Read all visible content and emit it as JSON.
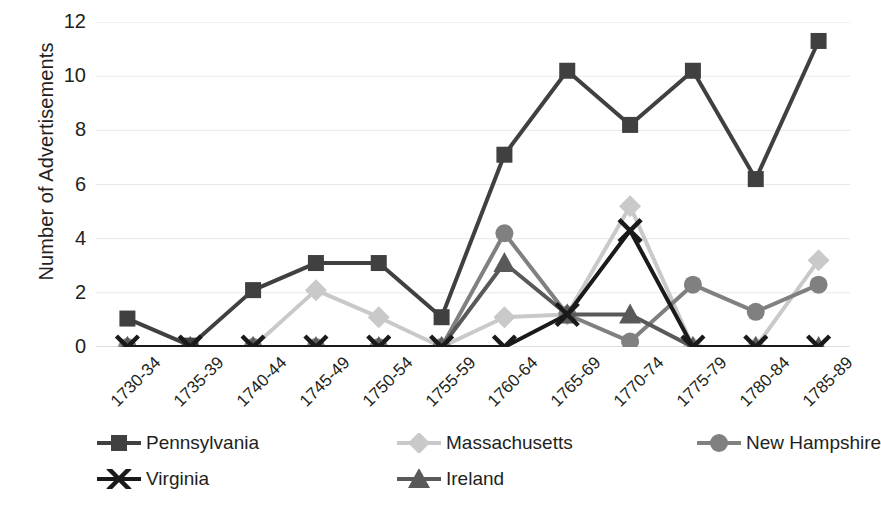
{
  "chart_data": {
    "type": "line",
    "title": "",
    "xlabel": "",
    "ylabel": "Number of Advertisements",
    "categories": [
      "1730-34",
      "1735-39",
      "1740-44",
      "1745-49",
      "1750-54",
      "1755-59",
      "1760-64",
      "1765-69",
      "1770-74",
      "1775-79",
      "1780-84",
      "1785-89"
    ],
    "ylim": [
      0,
      12
    ],
    "yticks": [
      0,
      2,
      4,
      6,
      8,
      10,
      12
    ],
    "grid": true,
    "legend_position": "bottom",
    "series": [
      {
        "name": "Pennsylvania",
        "marker": "square",
        "color": "#404040",
        "values": [
          1.05,
          0.05,
          2.1,
          3.1,
          3.1,
          1.1,
          7.1,
          10.2,
          8.2,
          10.2,
          6.2,
          11.3
        ]
      },
      {
        "name": "Massachusetts",
        "marker": "diamond",
        "color": "#c9c9c9",
        "values": [
          0,
          0,
          0,
          2.1,
          1.1,
          0,
          1.1,
          1.2,
          5.2,
          0,
          0,
          3.2
        ]
      },
      {
        "name": "New Hampshire",
        "marker": "circle",
        "color": "#808080",
        "values": [
          0,
          0,
          0,
          0,
          0,
          0,
          4.2,
          1.2,
          0.2,
          2.3,
          1.3,
          2.3
        ]
      },
      {
        "name": "Virginia",
        "marker": "cross",
        "color": "#1a1a1a",
        "values": [
          0,
          0,
          0,
          0,
          0,
          0,
          0,
          1.2,
          4.3,
          0,
          0,
          0
        ]
      },
      {
        "name": "Ireland",
        "marker": "triangle",
        "color": "#595959",
        "values": [
          0,
          0,
          0,
          0,
          0,
          0,
          3.1,
          1.2,
          1.2,
          0,
          0,
          0
        ]
      }
    ]
  },
  "legend": {
    "items": [
      {
        "label": "Pennsylvania"
      },
      {
        "label": "Massachusetts"
      },
      {
        "label": "New Hampshire"
      },
      {
        "label": "Virginia"
      },
      {
        "label": "Ireland"
      }
    ]
  }
}
